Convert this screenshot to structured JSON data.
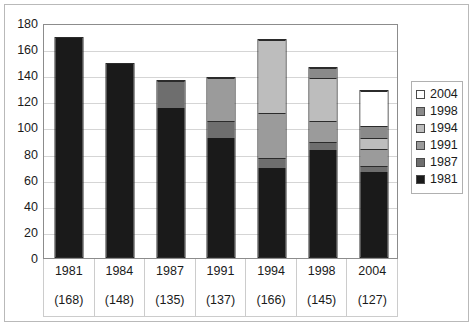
{
  "chart_data": {
    "type": "bar",
    "title": "",
    "subtitle": "",
    "xlabel": "",
    "ylabel": "",
    "stacked": true,
    "grid": true,
    "legend_position": "right",
    "ylim": [
      0,
      180
    ],
    "ytick_step": 20,
    "ytick_labels": [
      "180",
      "160",
      "140",
      "120",
      "100",
      "80",
      "60",
      "40",
      "20",
      "0"
    ],
    "yticks": [
      180,
      160,
      140,
      120,
      100,
      80,
      60,
      40,
      20,
      0
    ],
    "categories": [
      "1981",
      "1984",
      "1987",
      "1991",
      "1994",
      "1998",
      "2004"
    ],
    "category_totals": [
      168,
      148,
      135,
      137,
      166,
      145,
      127
    ],
    "category_total_labels": [
      "(168)",
      "(148)",
      "(135)",
      "(137)",
      "(166)",
      "(145)",
      "(127)"
    ],
    "series": [
      {
        "name": "1981",
        "color": "#1a1a1a",
        "values": [
          168,
          148,
          114,
          91,
          68,
          82,
          65
        ]
      },
      {
        "name": "1987",
        "color": "#6e6e6e",
        "values": [
          0,
          0,
          21,
          13,
          8,
          6,
          5
        ]
      },
      {
        "name": "1991",
        "color": "#9b9b9b",
        "values": [
          0,
          0,
          0,
          33,
          34,
          16,
          13
        ]
      },
      {
        "name": "1994",
        "color": "#bdbdbd",
        "values": [
          0,
          0,
          0,
          0,
          56,
          33,
          8
        ]
      },
      {
        "name": "1998",
        "color": "#8a8a8a",
        "values": [
          0,
          0,
          0,
          0,
          0,
          8,
          9
        ]
      },
      {
        "name": "2004",
        "color": "#ffffff",
        "values": [
          0,
          0,
          0,
          0,
          0,
          0,
          27
        ]
      }
    ],
    "legend_entries": [
      {
        "label": "2004",
        "color": "#ffffff"
      },
      {
        "label": "1998",
        "color": "#8a8a8a"
      },
      {
        "label": "1994",
        "color": "#bdbdbd"
      },
      {
        "label": "1991",
        "color": "#9b9b9b"
      },
      {
        "label": "1987",
        "color": "#6e6e6e"
      },
      {
        "label": "1981",
        "color": "#1a1a1a"
      }
    ]
  },
  "colors": {
    "plot_border": "#8c8c8c",
    "gridline": "#d5d5d5",
    "outer_border": "#b9b9b9",
    "axis_text": "#1a1a1a",
    "bar_outline": "#2b2b2b"
  }
}
